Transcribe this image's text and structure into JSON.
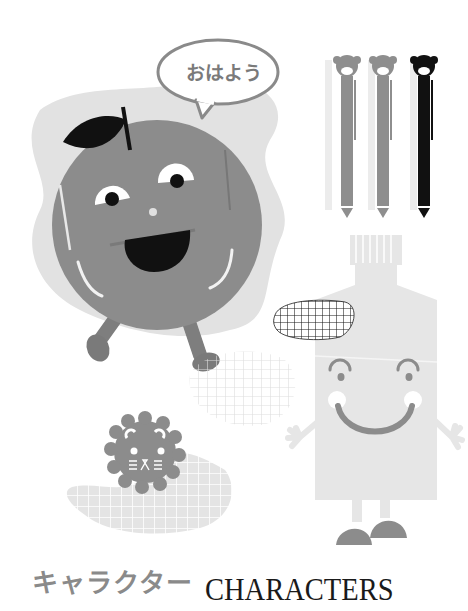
{
  "speech_bubble": {
    "text": "おはよう"
  },
  "title": {
    "japanese": "キャラクター",
    "english": "CHARACTERS"
  },
  "characters": [
    {
      "name": "apple",
      "description": "round smiling apple with leaf, walking"
    },
    {
      "name": "bear-pens",
      "count": 3,
      "colors": [
        "#8e8e8e",
        "#8e8e8e",
        "#111111"
      ]
    },
    {
      "name": "toothpaste-tube",
      "description": "smiling tube with arms and feet"
    },
    {
      "name": "lion-cookie",
      "description": "scalloped lion face"
    }
  ],
  "colors": {
    "character_gray": "#8c8c8c",
    "light_gray": "#e6e6e6",
    "blob_gray": "#e2e2e2",
    "black": "#111111",
    "bubble_stroke": "#8a8a8a"
  }
}
